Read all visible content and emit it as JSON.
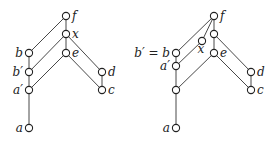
{
  "diagrams": [
    {
      "id": "left",
      "nodes": [
        {
          "id": "f",
          "x": 66,
          "y": 16,
          "label": "f",
          "label_side": "right"
        },
        {
          "id": "x",
          "x": 66,
          "y": 34,
          "label": "x",
          "label_side": "right"
        },
        {
          "id": "b",
          "x": 29,
          "y": 53,
          "label": "b",
          "label_side": "left"
        },
        {
          "id": "e",
          "x": 66,
          "y": 53,
          "label": "e",
          "label_side": "right"
        },
        {
          "id": "bp",
          "x": 29,
          "y": 72,
          "label": "b′",
          "label_side": "left"
        },
        {
          "id": "d",
          "x": 102,
          "y": 72,
          "label": "d",
          "label_side": "right"
        },
        {
          "id": "ap",
          "x": 29,
          "y": 90,
          "label": "a′",
          "label_side": "left"
        },
        {
          "id": "c",
          "x": 102,
          "y": 90,
          "label": "c",
          "label_side": "right"
        },
        {
          "id": "a",
          "x": 29,
          "y": 128,
          "label": "a",
          "label_side": "left"
        }
      ],
      "edges": [
        [
          "f",
          "b"
        ],
        [
          "f",
          "x"
        ],
        [
          "x",
          "bp"
        ],
        [
          "x",
          "e"
        ],
        [
          "x",
          "d"
        ],
        [
          "e",
          "ap"
        ],
        [
          "e",
          "c"
        ],
        [
          "b",
          "bp"
        ],
        [
          "bp",
          "ap"
        ],
        [
          "ap",
          "a"
        ],
        [
          "d",
          "c"
        ]
      ]
    },
    {
      "id": "right",
      "nodes": [
        {
          "id": "f",
          "x": 214,
          "y": 16,
          "label": "f",
          "label_side": "right"
        },
        {
          "id": "u1",
          "x": 214,
          "y": 34,
          "label": "",
          "label_side": "right"
        },
        {
          "id": "x",
          "x": 202,
          "y": 41,
          "label": "x",
          "label_side": "below-left"
        },
        {
          "id": "b",
          "x": 176,
          "y": 53,
          "label": "b′ = b",
          "label_side": "left"
        },
        {
          "id": "e",
          "x": 214,
          "y": 53,
          "label": "e",
          "label_side": "right"
        },
        {
          "id": "ap",
          "x": 176,
          "y": 66,
          "label": "a′",
          "label_side": "left"
        },
        {
          "id": "d",
          "x": 251,
          "y": 72,
          "label": "d",
          "label_side": "right"
        },
        {
          "id": "u2",
          "x": 176,
          "y": 90,
          "label": "",
          "label_side": "left"
        },
        {
          "id": "c",
          "x": 251,
          "y": 90,
          "label": "c",
          "label_side": "right"
        },
        {
          "id": "a",
          "x": 176,
          "y": 128,
          "label": "a",
          "label_side": "left"
        }
      ],
      "edges": [
        [
          "f",
          "b"
        ],
        [
          "f",
          "x"
        ],
        [
          "f",
          "u1"
        ],
        [
          "u1",
          "e"
        ],
        [
          "u1",
          "d"
        ],
        [
          "x",
          "ap"
        ],
        [
          "e",
          "u2"
        ],
        [
          "e",
          "c"
        ],
        [
          "b",
          "ap"
        ],
        [
          "ap",
          "u2"
        ],
        [
          "u2",
          "a"
        ],
        [
          "d",
          "c"
        ]
      ]
    }
  ],
  "style": {
    "line_color": "#333333",
    "node_fill": "#ffffff",
    "node_stroke": "#222222",
    "node_radius": 3.6
  }
}
